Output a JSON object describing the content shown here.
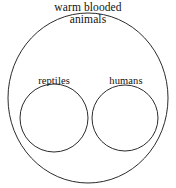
{
  "diagram": {
    "kind": "euler-diagram",
    "title": {
      "line_1": "warm blooded",
      "line_2": "animals"
    },
    "sets": [
      {
        "id": "universe",
        "label": "warm blooded animals",
        "role": "outer-set",
        "shape": "ellipse",
        "cx": 88,
        "cy": 98,
        "rx": 80,
        "ry": 85
      },
      {
        "id": "reptiles",
        "label": "reptiles",
        "role": "inner-set-left",
        "shape": "circle",
        "cx": 54,
        "cy": 118,
        "r": 34
      },
      {
        "id": "humans",
        "label": "humans",
        "role": "inner-set-right",
        "shape": "circle",
        "cx": 125,
        "cy": 118,
        "r": 33
      }
    ],
    "style": {
      "stroke": "#2b2b2b",
      "stroke_width": 1,
      "fill": "none",
      "background": "#ffffff",
      "text_color": "#111111"
    }
  }
}
